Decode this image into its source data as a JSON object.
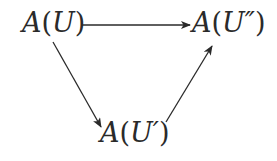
{
  "diagram": {
    "type": "commutative-triangle",
    "nodes": [
      {
        "id": "top-left",
        "label": "A(U)",
        "func": "A",
        "arg": "U"
      },
      {
        "id": "top-right",
        "label": "A(U″)",
        "func": "A",
        "arg": "U″"
      },
      {
        "id": "bottom",
        "label": "A(U′)",
        "func": "A",
        "arg": "U′"
      }
    ],
    "edges": [
      {
        "from": "top-left",
        "to": "top-right",
        "direction": "horizontal-right"
      },
      {
        "from": "top-left",
        "to": "bottom",
        "direction": "down-right"
      },
      {
        "from": "bottom",
        "to": "top-right",
        "direction": "up-right"
      }
    ],
    "colors": {
      "text": "#2a2a2a",
      "arrow": "#2a2a2a",
      "background": "#ffffff"
    }
  }
}
